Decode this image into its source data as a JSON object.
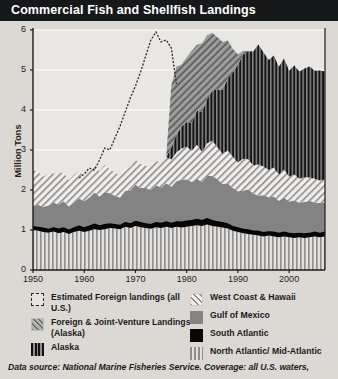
{
  "header": {
    "title": "Commercial Fish and Shellfish Landings"
  },
  "footer": {
    "text": "Data source: National Marine Fisheries Service. Coverage: all U.S. waters,"
  },
  "legend": {
    "left": [
      {
        "key": "estimated-foreign",
        "label": "Estimated Foreign landings (all U.S.)",
        "swatch": "sw-est"
      },
      {
        "key": "foreign-joint-venture",
        "label": "Foreign & Joint-Venture Landings (Alaska)",
        "swatch": "sw-fjv"
      },
      {
        "key": "alaska",
        "label": "Alaska",
        "swatch": "sw-ak"
      }
    ],
    "right": [
      {
        "key": "west-coast-hawaii",
        "label": "West Coast & Hawaii",
        "swatch": "sw-wc"
      },
      {
        "key": "gulf-of-mexico",
        "label": "Gulf of Mexico",
        "swatch": "sw-gm"
      },
      {
        "key": "south-atlantic",
        "label": "South Atlantic",
        "swatch": "sw-sa"
      },
      {
        "key": "north-atlantic-mid-atlantic",
        "label": "North Atlantic/ Mid-Atlantic",
        "swatch": "sw-na"
      }
    ]
  },
  "colors": {
    "title_bar": "#17181a",
    "background": "#dcd9d4",
    "plot_background": "#e9e7e3",
    "axis": "#1d1d1d",
    "south_atlantic": "#070707",
    "gulf_of_mexico": "#838383",
    "alaska": "#111111"
  },
  "chart_data": {
    "type": "area",
    "stacked": true,
    "title": "Commercial Fish and Shellfish Landings",
    "xlabel": "",
    "ylabel": "Million Tons",
    "xlim": [
      1950,
      2007
    ],
    "ylim": [
      0,
      6
    ],
    "yticks": [
      0,
      1,
      2,
      3,
      4,
      5,
      6
    ],
    "xticks": [
      1950,
      1960,
      1970,
      1980,
      1990,
      2000
    ],
    "grid": "horizontal",
    "legend_position": "bottom",
    "x": [
      1950,
      1951,
      1952,
      1953,
      1954,
      1955,
      1956,
      1957,
      1958,
      1959,
      1960,
      1961,
      1962,
      1963,
      1964,
      1965,
      1966,
      1967,
      1968,
      1969,
      1970,
      1971,
      1972,
      1973,
      1974,
      1975,
      1976,
      1977,
      1978,
      1979,
      1980,
      1981,
      1982,
      1983,
      1984,
      1985,
      1986,
      1987,
      1988,
      1989,
      1990,
      1991,
      1992,
      1993,
      1994,
      1995,
      1996,
      1997,
      1998,
      1999,
      2000,
      2001,
      2002,
      2003,
      2004,
      2005,
      2006,
      2007
    ],
    "series": [
      {
        "name": "North Atlantic/ Mid-Atlantic",
        "key": "north-atlantic-mid-atlantic",
        "pattern": "vertical-stripes",
        "values": [
          1.0,
          0.98,
          0.95,
          0.93,
          0.96,
          0.92,
          0.95,
          0.9,
          0.95,
          0.98,
          0.95,
          0.98,
          1.02,
          1.0,
          1.02,
          1.05,
          1.04,
          1.02,
          1.08,
          1.05,
          1.1,
          1.07,
          1.05,
          1.03,
          1.07,
          1.05,
          1.08,
          1.05,
          1.08,
          1.06,
          1.08,
          1.1,
          1.12,
          1.1,
          1.14,
          1.1,
          1.08,
          1.06,
          1.04,
          0.98,
          0.95,
          0.92,
          0.9,
          0.88,
          0.86,
          0.84,
          0.86,
          0.84,
          0.82,
          0.84,
          0.82,
          0.8,
          0.82,
          0.8,
          0.82,
          0.84,
          0.82,
          0.84
        ]
      },
      {
        "name": "South Atlantic",
        "key": "south-atlantic",
        "pattern": "solid-black",
        "values": [
          0.1,
          0.1,
          0.11,
          0.1,
          0.11,
          0.12,
          0.12,
          0.11,
          0.12,
          0.13,
          0.12,
          0.13,
          0.14,
          0.12,
          0.13,
          0.12,
          0.11,
          0.11,
          0.12,
          0.12,
          0.13,
          0.13,
          0.12,
          0.12,
          0.13,
          0.13,
          0.14,
          0.13,
          0.14,
          0.15,
          0.16,
          0.15,
          0.16,
          0.15,
          0.16,
          0.15,
          0.14,
          0.14,
          0.13,
          0.12,
          0.12,
          0.11,
          0.12,
          0.11,
          0.12,
          0.11,
          0.11,
          0.12,
          0.11,
          0.12,
          0.11,
          0.12,
          0.11,
          0.12,
          0.11,
          0.12,
          0.11,
          0.12
        ]
      },
      {
        "name": "Gulf of Mexico",
        "key": "gulf-of-mexico",
        "pattern": "solid-gray",
        "values": [
          0.5,
          0.55,
          0.52,
          0.58,
          0.62,
          0.6,
          0.65,
          0.58,
          0.62,
          0.68,
          0.65,
          0.7,
          0.78,
          0.72,
          0.8,
          0.75,
          0.7,
          0.68,
          0.78,
          0.82,
          0.9,
          0.85,
          0.88,
          0.85,
          0.92,
          0.88,
          0.95,
          0.9,
          1.0,
          1.05,
          1.02,
          0.95,
          1.0,
          0.95,
          1.05,
          1.1,
          1.05,
          0.95,
          1.0,
          0.95,
          0.9,
          0.95,
          1.0,
          0.92,
          0.88,
          0.92,
          0.85,
          0.88,
          0.8,
          0.85,
          0.78,
          0.82,
          0.75,
          0.78,
          0.8,
          0.72,
          0.75,
          0.72
        ]
      },
      {
        "name": "West Coast & Hawaii",
        "key": "west-coast-hawaii",
        "pattern": "diagonal-light",
        "values": [
          0.9,
          0.82,
          0.75,
          0.8,
          0.72,
          0.78,
          0.72,
          0.65,
          0.7,
          0.68,
          0.62,
          0.65,
          0.7,
          0.62,
          0.68,
          0.6,
          0.58,
          0.55,
          0.6,
          0.58,
          0.62,
          0.6,
          0.55,
          0.58,
          0.62,
          0.6,
          0.65,
          0.68,
          0.72,
          0.78,
          0.82,
          0.78,
          0.85,
          0.75,
          0.82,
          0.88,
          0.8,
          0.75,
          0.82,
          0.78,
          0.72,
          0.8,
          0.75,
          0.7,
          0.78,
          0.72,
          0.68,
          0.72,
          0.65,
          0.7,
          0.62,
          0.65,
          0.6,
          0.62,
          0.58,
          0.6,
          0.56,
          0.58
        ]
      },
      {
        "name": "Alaska",
        "key": "alaska",
        "pattern": "dark-vertical-stripes",
        "values": [
          0,
          0,
          0,
          0,
          0,
          0,
          0,
          0,
          0,
          0,
          0,
          0,
          0,
          0,
          0,
          0,
          0,
          0,
          0,
          0,
          0,
          0,
          0,
          0,
          0,
          0,
          0,
          0.3,
          0.45,
          0.55,
          0.62,
          0.7,
          0.85,
          1.0,
          1.1,
          1.25,
          1.45,
          1.6,
          1.8,
          2.1,
          2.45,
          2.6,
          2.7,
          2.85,
          3.0,
          2.85,
          2.75,
          2.8,
          2.7,
          2.78,
          2.65,
          2.72,
          2.68,
          2.72,
          2.78,
          2.7,
          2.75,
          2.7
        ]
      },
      {
        "name": "Foreign & Joint-Venture Landings (Alaska)",
        "key": "foreign-joint-venture",
        "pattern": "diagonal-dark",
        "values": [
          0,
          0,
          0,
          0,
          0,
          0,
          0,
          0,
          0,
          0,
          0,
          0,
          0,
          0,
          0,
          0,
          0,
          0,
          0,
          0,
          0,
          0,
          0,
          0,
          0,
          0,
          0,
          1.55,
          1.7,
          1.55,
          1.62,
          1.8,
          1.65,
          1.72,
          1.6,
          1.45,
          1.3,
          1.2,
          0.95,
          0.6,
          0.25,
          0.1,
          0,
          0,
          0,
          0,
          0,
          0,
          0,
          0,
          0,
          0,
          0,
          0,
          0,
          0,
          0,
          0
        ]
      }
    ],
    "overlay_line": {
      "name": "Estimated Foreign landings (all U.S.)",
      "key": "estimated-foreign",
      "style": "dotted",
      "x": [
        1959,
        1960,
        1961,
        1962,
        1963,
        1964,
        1965,
        1966,
        1967,
        1968,
        1969,
        1970,
        1971,
        1972,
        1973,
        1974,
        1975,
        1976,
        1977,
        1978
      ],
      "values": [
        2.3,
        2.4,
        2.55,
        2.5,
        2.75,
        3.05,
        3.0,
        3.3,
        3.6,
        3.95,
        4.3,
        4.6,
        4.95,
        5.35,
        5.75,
        5.95,
        5.7,
        5.75,
        5.55,
        4.65
      ]
    }
  }
}
